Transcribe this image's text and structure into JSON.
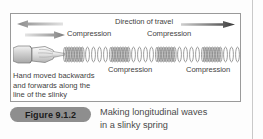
{
  "figure": {
    "badge_label": "Figure 9.1.2",
    "caption_line_1": "Making longitudinal waves",
    "caption_line_2": "in a slinky spring"
  },
  "panel": {
    "direction_label": "Direction of travel",
    "compression_labels": [
      "Compression",
      "Compression",
      "Compression",
      "Compression"
    ],
    "hand_note_line_1": "Hand moved backwards",
    "hand_note_line_2": "and forwards along the",
    "hand_note_line_3": "line of the slinky"
  },
  "icons": {
    "direction_arrow": "arrow-right-icon",
    "hand_arrow_left": "arrow-left-icon",
    "hand_arrow_right": "arrow-right-icon",
    "hand": "hand-illustration-icon",
    "slinky": "slinky-spring-icon"
  },
  "colors": {
    "text": "#3f3f3f",
    "caption_text": "#4a4a4a",
    "badge_background": "#8e8e8e",
    "badge_text": "#1a1a1a",
    "panel_border": "#9a9a9a",
    "arrow_dark": "#4a4a4a",
    "arrow_light": "#d8d8d8",
    "coil": "#8a8a8a",
    "page_rule": "#c9c9c9"
  }
}
